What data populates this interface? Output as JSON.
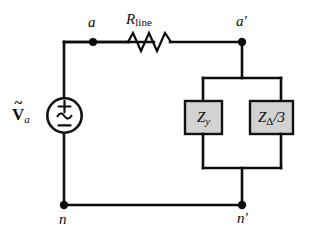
{
  "diagram": {
    "background_color": "#ffffff",
    "wire_color": "#0d0d0d",
    "impedance_fill_color": "#d2d2d2"
  },
  "source": {
    "name": "ac-voltage-source",
    "label_main": "V",
    "label_accent": "~",
    "label_subscript": "a",
    "symbol_plus": "+",
    "symbol_ac": "∼",
    "symbol_minus": "−"
  },
  "resistor": {
    "name": "line-resistor",
    "label_main": "R",
    "label_subscript": "line"
  },
  "impedances": [
    {
      "name": "wye-impedance",
      "label_main": "Z",
      "label_subscript": "y",
      "label_suffix": ""
    },
    {
      "name": "delta-impedance-over-three",
      "label_main": "Z",
      "label_subscript": "Δ",
      "label_suffix": "/3"
    }
  ],
  "nodes": [
    {
      "name": "node-a",
      "label": "a"
    },
    {
      "name": "node-a-prime",
      "label": "a′"
    },
    {
      "name": "node-n",
      "label": "n"
    },
    {
      "name": "node-n-prime",
      "label": "n′"
    }
  ]
}
